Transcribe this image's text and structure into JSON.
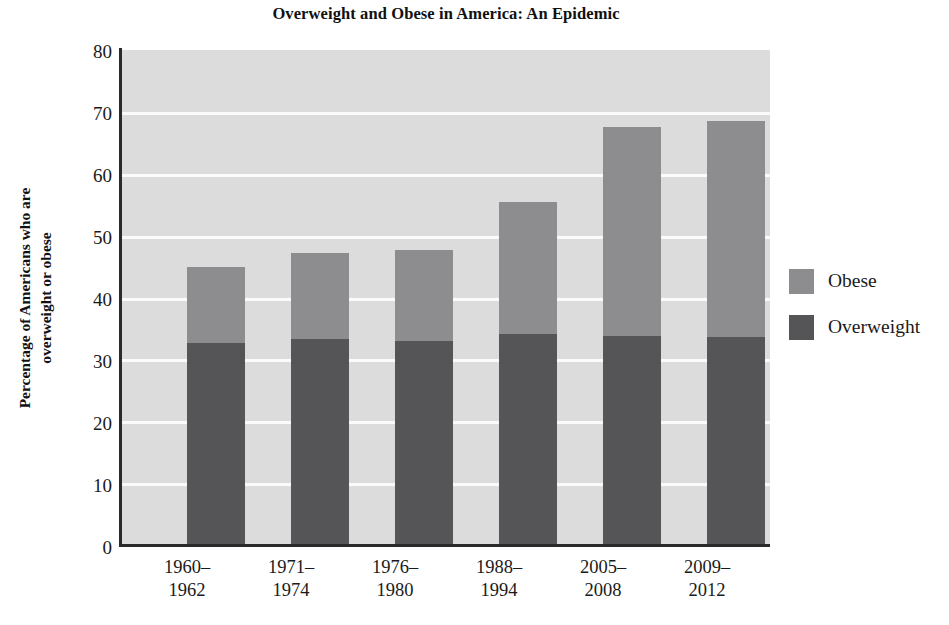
{
  "chart_data": {
    "type": "bar",
    "subtype": "stacked-bar",
    "title": "Overweight and Obese in America: An Epidemic",
    "xlabel": "",
    "ylabel_line1": "Percentage of Americans who are",
    "ylabel_line2": "overweight or obese",
    "ylabel": "Percentage of Americans who are overweight or obese",
    "categories": [
      "1960–\n1962",
      "1971–\n1974",
      "1976–\n1980",
      "1988–\n1994",
      "2005–\n2008",
      "2009–\n2012"
    ],
    "categories_lines": [
      [
        "1960–",
        "1962"
      ],
      [
        "1971–",
        "1974"
      ],
      [
        "1976–",
        "1980"
      ],
      [
        "1988–",
        "1994"
      ],
      [
        "2005–",
        "2008"
      ],
      [
        "2009–",
        "2012"
      ]
    ],
    "series": [
      {
        "name": "Overweight",
        "color": "#555558",
        "values": [
          32.7,
          33.3,
          33.0,
          34.1,
          33.7,
          33.6
        ]
      },
      {
        "name": "Obese",
        "color": "#8d8d90",
        "values": [
          12.3,
          13.9,
          14.6,
          21.4,
          33.8,
          35.0
        ]
      }
    ],
    "totals": [
      45.0,
      47.2,
      47.6,
      55.5,
      67.5,
      68.6
    ],
    "ylim": [
      0,
      80
    ],
    "yticks": [
      0,
      10,
      20,
      30,
      40,
      50,
      60,
      70,
      80
    ],
    "ytick_labels": [
      "0",
      "10",
      "20",
      "30",
      "40",
      "50",
      "60",
      "70",
      "80"
    ],
    "grid": true,
    "grid_color": "#fbfbfb",
    "plot_background": "#dcdcdc",
    "legend_position": "right",
    "legend": [
      {
        "label": "Obese",
        "color": "#8d8d90"
      },
      {
        "label": "Overweight",
        "color": "#555558"
      }
    ]
  }
}
